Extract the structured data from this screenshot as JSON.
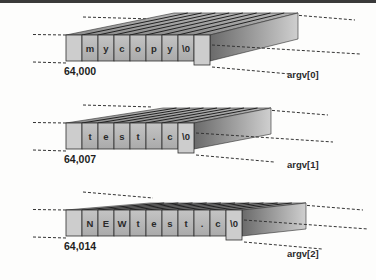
{
  "diagram": {
    "title": "",
    "colors": {
      "background": "#fdfdfc",
      "cell_face": "#b9b9b9",
      "cell_face_light": "#cdcdcd",
      "cell_border": "#2e2e2e",
      "top_face": "#9a9a9a",
      "side_face_dark": "#6e6e6e",
      "side_face_light": "#c8c8c8",
      "dash": "#333333"
    },
    "strings": [
      {
        "id": "argv0",
        "label": "argv[0]",
        "address": "64,000",
        "cells": [
          "",
          "m",
          "y",
          "c",
          "o",
          "p",
          "y",
          "\\0",
          ""
        ]
      },
      {
        "id": "argv1",
        "label": "argv[1]",
        "address": "64,007",
        "cells": [
          "",
          "t",
          "e",
          "s",
          "t",
          ".",
          "c",
          "\\0"
        ]
      },
      {
        "id": "argv2",
        "label": "argv[2]",
        "address": "64,014",
        "cells": [
          "",
          "N",
          "E",
          "W",
          "t",
          "e",
          "s",
          "t",
          ".",
          "c",
          "\\0"
        ]
      }
    ]
  }
}
